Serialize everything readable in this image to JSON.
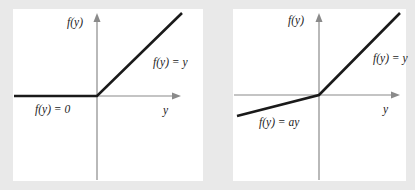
{
  "figure": {
    "panels": [
      {
        "id": "relu",
        "y_axis_label": "f(y)",
        "x_axis_label": "y",
        "right_label": "f(y) = y",
        "left_label": "f(y) = 0"
      },
      {
        "id": "leaky-relu",
        "y_axis_label": "f(y)",
        "x_axis_label": "y",
        "right_label": "f(y) = y",
        "left_label": "f(y) = ay"
      }
    ],
    "colors": {
      "background": "#e9e9e9",
      "panel": "#ffffff",
      "axis": "#8a8a8a",
      "curve": "#1a1a1a"
    }
  }
}
